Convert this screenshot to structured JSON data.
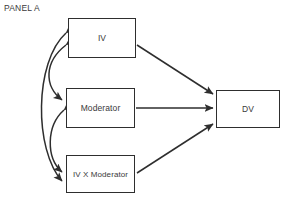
{
  "diagram": {
    "panel_label": "PANEL A",
    "type": "path-model-diagram",
    "nodes": [
      {
        "id": "iv",
        "label": "IV",
        "x": 68,
        "y": 18,
        "w": 68,
        "h": 40
      },
      {
        "id": "moderator",
        "label": "Moderator",
        "x": 66,
        "y": 88,
        "w": 69,
        "h": 40
      },
      {
        "id": "ivxmod",
        "label": "IV X Moderator",
        "x": 66,
        "y": 155,
        "w": 69,
        "h": 38
      },
      {
        "id": "dv",
        "label": "DV",
        "x": 216,
        "y": 90,
        "w": 64,
        "h": 38
      }
    ],
    "straight_arrows": [
      {
        "from": "iv",
        "to": "dv",
        "style": "single-headed"
      },
      {
        "from": "moderator",
        "to": "dv",
        "style": "single-headed"
      },
      {
        "from": "ivxmod",
        "to": "dv",
        "style": "single-headed"
      }
    ],
    "curved_arrows": [
      {
        "between": [
          "iv",
          "moderator"
        ],
        "style": "double-headed-curve"
      },
      {
        "between": [
          "iv",
          "ivxmod"
        ],
        "style": "double-headed-curve"
      },
      {
        "between": [
          "moderator",
          "ivxmod"
        ],
        "style": "double-headed-curve"
      }
    ],
    "colors": {
      "box_border": "#2e2e2e",
      "arrow": "#2e2e2e",
      "text": "#3a3a3a",
      "background": "#ffffff"
    }
  }
}
